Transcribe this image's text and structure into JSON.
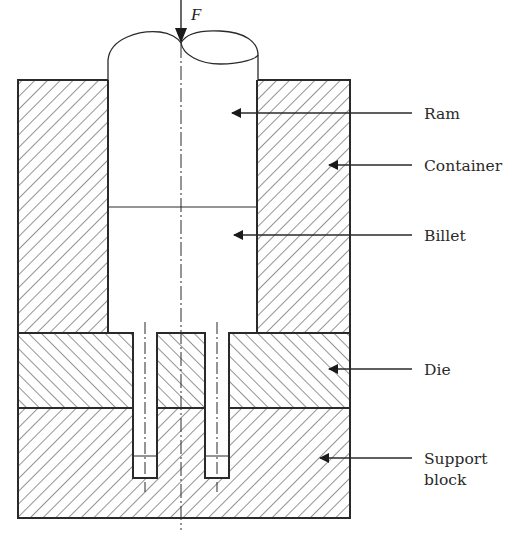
{
  "diagram": {
    "force_label": "F",
    "labels": [
      {
        "id": "ram",
        "text": "Ram"
      },
      {
        "id": "container",
        "text": "Container"
      },
      {
        "id": "billet",
        "text": "Billet"
      },
      {
        "id": "die",
        "text": "Die"
      },
      {
        "id": "support",
        "line1": "Support",
        "line2": "block"
      }
    ],
    "colors": {
      "line": "#2a2a2a",
      "hatch": "#3a3a3a",
      "background": "#ffffff"
    }
  }
}
